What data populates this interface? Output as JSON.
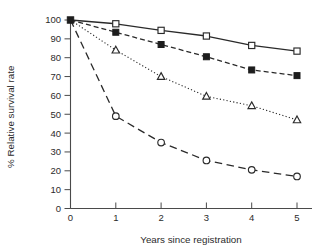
{
  "chart_data": {
    "type": "line",
    "title": "",
    "xlabel": "Years since registration",
    "ylabel": "% Relative survival rate",
    "x": [
      0,
      1,
      2,
      3,
      4,
      5
    ],
    "xlim": [
      0,
      5.4
    ],
    "ylim": [
      0,
      104
    ],
    "xticks": [
      "0",
      "1",
      "2",
      "3",
      "4",
      "5"
    ],
    "yticks": [
      "0",
      "10",
      "20",
      "30",
      "40",
      "50",
      "60",
      "70",
      "80",
      "90",
      "100"
    ],
    "grid": false,
    "legend": "none",
    "series": [
      {
        "name": "open-square-solid",
        "marker": "open-square",
        "line_style": "solid",
        "color": "#2a2a2a",
        "values": [
          100,
          98,
          94.5,
          91.5,
          86.5,
          83.5
        ]
      },
      {
        "name": "filled-square-dashed",
        "marker": "filled-square",
        "line_style": "dashed",
        "color": "#1d1d1d",
        "values": [
          100,
          93.5,
          87,
          80.5,
          73.5,
          70.5
        ]
      },
      {
        "name": "open-triangle-dotted",
        "marker": "open-triangle",
        "line_style": "dotted",
        "color": "#2a2a2a",
        "values": [
          100,
          84,
          70,
          59.5,
          54.5,
          47
        ]
      },
      {
        "name": "open-circle-longdash",
        "marker": "open-circle",
        "line_style": "longdash",
        "color": "#2a2a2a",
        "values": [
          100,
          49,
          35,
          25.5,
          20.5,
          17
        ]
      }
    ]
  }
}
